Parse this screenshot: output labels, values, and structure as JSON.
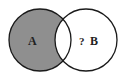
{
  "diagram": {
    "type": "venn",
    "circles": [
      {
        "id": "A",
        "label": "A",
        "cx": 40,
        "cy": 40,
        "r": 31
      },
      {
        "id": "B",
        "label": "B",
        "cx": 86,
        "cy": 40,
        "r": 31
      }
    ],
    "shaded_region": "A minus B",
    "unknown_marker": "?",
    "colors": {
      "shade": "#8f8f8f",
      "stroke": "#1a1a1a",
      "background": "#ffffff"
    }
  }
}
